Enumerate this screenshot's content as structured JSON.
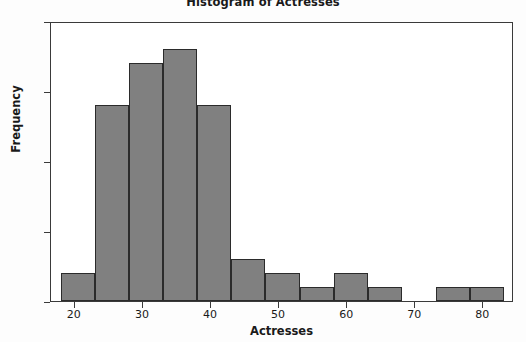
{
  "chart_data": {
    "type": "bar",
    "title": "Histogram of Actresses",
    "xlabel": "Actresses",
    "ylabel": "Frequency",
    "xlim": [
      16.5,
      84.5
    ],
    "ylim": [
      0,
      20
    ],
    "grid": false,
    "legend": null,
    "bin_width": 5,
    "bin_edges": [
      18,
      23,
      28,
      33,
      38,
      43,
      48,
      53,
      58,
      63,
      68,
      73,
      78,
      83
    ],
    "categories": [
      "18-23",
      "23-28",
      "28-33",
      "33-38",
      "38-43",
      "43-48",
      "48-53",
      "53-58",
      "58-63",
      "63-68",
      "68-73",
      "73-78",
      "78-83"
    ],
    "values": [
      2,
      14,
      17,
      18,
      14,
      3,
      2,
      1,
      2,
      1,
      0,
      1,
      1
    ],
    "xticks": [
      20,
      30,
      40,
      50,
      60,
      70,
      80
    ],
    "xtick_labels": [
      "20",
      "30",
      "40",
      "50",
      "60",
      "70",
      "80"
    ],
    "yticks": [
      0,
      5,
      10,
      15,
      20
    ],
    "ytick_labels": [
      "0",
      "5",
      "10",
      "15",
      "20"
    ],
    "bar_color": "#808080",
    "bar_edge_color": "#2b2b2b",
    "background_color": "#ffffff"
  }
}
